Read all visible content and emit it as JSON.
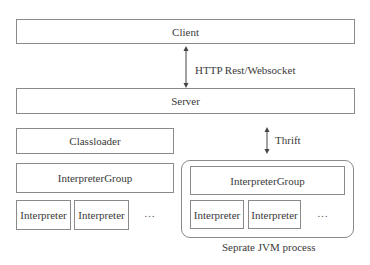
{
  "diagram": {
    "client": {
      "label": "Client"
    },
    "server": {
      "label": "Server"
    },
    "http_link": {
      "label": "HTTP Rest/Websocket"
    },
    "thrift_link": {
      "label": "Thrift"
    },
    "local": {
      "classloader": {
        "label": "Classloader"
      },
      "interpreter_group": {
        "label": "InterpreterGroup"
      },
      "interpreters": [
        {
          "label": "Interpreter"
        },
        {
          "label": "Interpreter"
        }
      ],
      "ellipsis": "…"
    },
    "remote": {
      "interpreter_group": {
        "label": "InterpreterGroup"
      },
      "interpreters": [
        {
          "label": "Interpreter"
        },
        {
          "label": "Interpreter"
        }
      ],
      "ellipsis": "…",
      "caption": "Seprate JVM process"
    }
  }
}
